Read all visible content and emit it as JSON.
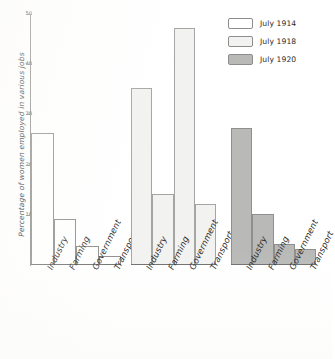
{
  "chart_data": {
    "type": "bar",
    "title": "",
    "subtitle": "",
    "xlabel": "",
    "ylabel": "Percentage of women employed in various jobs",
    "categories": [
      "Industry",
      "Farming",
      "Government",
      "Transport"
    ],
    "series": [
      {
        "name": "July 1914",
        "color": "#ffffff",
        "values": [
          26,
          9,
          3.5,
          1.5
        ]
      },
      {
        "name": "July 1918",
        "color": "#f2f2f0",
        "values": [
          35,
          14,
          47,
          12
        ]
      },
      {
        "name": "July 1920",
        "color": "#b9b9b7",
        "values": [
          27,
          10,
          4,
          3
        ]
      }
    ],
    "ylim": [
      0,
      50
    ],
    "yticks": [
      10,
      20,
      30,
      40,
      50
    ],
    "ytick_labels": [
      "10",
      "20",
      "30",
      "40",
      "50"
    ],
    "grid": false,
    "legend_position": "top-right",
    "grouping": "series-panels"
  },
  "legend": {
    "entries": [
      {
        "label": "July 1914",
        "swatch": "white-swatch"
      },
      {
        "label": "July 1918",
        "swatch": "light-gray-swatch"
      },
      {
        "label": "July 1920",
        "swatch": "medium-gray-swatch"
      }
    ]
  },
  "axis": {
    "y_title": "Percentage of women employed in various jobs",
    "y_ticks": [
      "50",
      "40",
      "30",
      "20",
      "10"
    ]
  },
  "panels": [
    {
      "series": "July 1914",
      "categories": [
        "Industry",
        "Farming",
        "Government",
        "Transport"
      ]
    },
    {
      "series": "July 1918",
      "categories": [
        "Industry",
        "Farming",
        "Government",
        "Transport"
      ]
    },
    {
      "series": "July 1920",
      "categories": [
        "Industry",
        "Farming",
        "Government",
        "Transport"
      ]
    }
  ],
  "colors": {
    "series_1914": "#ffffff",
    "series_1918": "#f2f2f0",
    "series_1920": "#b9b9b7",
    "axis": "#8a8a8a",
    "ink": "#2a2a2a"
  }
}
